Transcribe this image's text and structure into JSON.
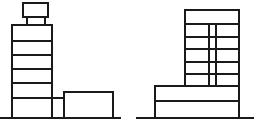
{
  "diagram": {
    "type": "building-elevations",
    "stroke_color": "#1a1a1a",
    "background": "#ffffff",
    "left_building": {
      "cap": {
        "x": 23,
        "y": 3,
        "w": 25,
        "h": 14
      },
      "neck": {
        "x1": 27,
        "x2": 45,
        "y1": 17,
        "y2": 25
      },
      "tower": {
        "x": 12,
        "y": 25,
        "w": 40,
        "h": 93
      },
      "floor_lines_y": [
        41,
        55,
        69,
        83,
        98
      ],
      "connector": {
        "x1": 52,
        "x2": 64,
        "y": 98
      },
      "annex": {
        "x": 64,
        "y": 92,
        "w": 49,
        "h": 26
      },
      "ground": {
        "x1": 0,
        "x2": 121,
        "y": 118
      }
    },
    "right_building": {
      "tower": {
        "x": 185,
        "y": 10,
        "w": 54,
        "h": 76
      },
      "floor_lines_y": [
        24,
        37,
        49,
        62,
        74
      ],
      "core_lines_x": [
        209,
        216
      ],
      "core_y": {
        "top": 24,
        "bottom": 86
      },
      "podium": {
        "x": 155,
        "y": 86,
        "w": 84,
        "h": 32
      },
      "podium_mid_y": 101,
      "ground": {
        "x1": 136,
        "x2": 254,
        "y": 118
      }
    }
  }
}
